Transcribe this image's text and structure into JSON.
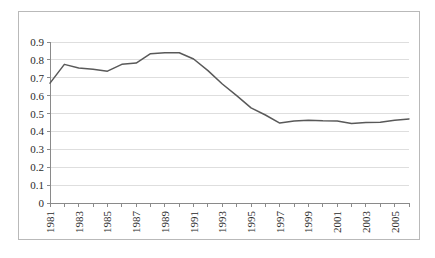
{
  "chart_data": {
    "type": "line",
    "title": "",
    "subtitle": "",
    "xlabel": "",
    "ylabel": "",
    "grid": true,
    "legend": false,
    "legend_position": "none",
    "line_color": "#595959",
    "gridline_color": "#d6d6d6",
    "axis_color": "#8a8a8a",
    "background_color": "#ffffff",
    "border_color": "#b9b9b9",
    "ylim": [
      0,
      0.9
    ],
    "ytick_step": 0.1,
    "ytick_labels": [
      "0.9",
      "0.8",
      "0.7",
      "0.6",
      "0.5",
      "0.4",
      "0.3",
      "0.2",
      "0.1",
      "0"
    ],
    "ytick_values": [
      0.9,
      0.8,
      0.7,
      0.6,
      0.5,
      0.4,
      0.3,
      0.2,
      0.1,
      0
    ],
    "xlim": [
      1981,
      2006
    ],
    "xtick_labels": [
      "1981",
      "1983",
      "1985",
      "1987",
      "1989",
      "1991",
      "1993",
      "1995",
      "1997",
      "1999",
      "2001",
      "2003",
      "2005"
    ],
    "xtick_label_rotation": -90,
    "x": [
      1981,
      1982,
      1983,
      1984,
      1985,
      1986,
      1987,
      1988,
      1989,
      1990,
      1991,
      1992,
      1993,
      1994,
      1995,
      1996,
      1997,
      1998,
      1999,
      2000,
      2001,
      2002,
      2003,
      2004,
      2005,
      2006
    ],
    "values": [
      0.67,
      0.775,
      0.755,
      0.748,
      0.737,
      0.775,
      0.782,
      0.835,
      0.84,
      0.84,
      0.805,
      0.74,
      0.665,
      0.6,
      0.532,
      0.492,
      0.447,
      0.458,
      0.463,
      0.46,
      0.459,
      0.444,
      0.45,
      0.452,
      0.462,
      0.47
    ],
    "series": [
      {
        "name": "series-1",
        "values": [
          0.67,
          0.775,
          0.755,
          0.748,
          0.737,
          0.775,
          0.782,
          0.835,
          0.84,
          0.84,
          0.805,
          0.74,
          0.665,
          0.6,
          0.532,
          0.492,
          0.447,
          0.458,
          0.463,
          0.46,
          0.459,
          0.444,
          0.45,
          0.452,
          0.462,
          0.47
        ]
      }
    ]
  }
}
